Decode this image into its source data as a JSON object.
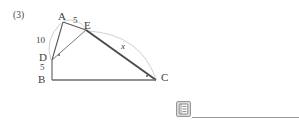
{
  "problem": {
    "index_label": "(3)"
  },
  "figure": {
    "type": "geometry-diagram",
    "vertices": [
      {
        "id": "A",
        "label": "A",
        "x": 63,
        "y": 22
      },
      {
        "id": "E",
        "label": "E",
        "x": 86,
        "y": 30
      },
      {
        "id": "D",
        "label": "D",
        "x": 52,
        "y": 60
      },
      {
        "id": "B",
        "label": "B",
        "x": 52,
        "y": 80
      },
      {
        "id": "C",
        "label": "C",
        "x": 155,
        "y": 80
      }
    ],
    "segment_labels": [
      {
        "id": "AD",
        "text": "10",
        "x": 40,
        "y": 41
      },
      {
        "id": "AE",
        "text": "5",
        "x": 74,
        "y": 22
      },
      {
        "id": "DB",
        "text": "5",
        "x": 41,
        "y": 68
      },
      {
        "id": "EC",
        "text": "x",
        "x": 122,
        "y": 46
      }
    ],
    "vertex_label_positions": [
      {
        "id": "A",
        "x": 58,
        "y": 12
      },
      {
        "id": "E",
        "x": 84,
        "y": 22
      },
      {
        "id": "D",
        "x": 40,
        "y": 52
      },
      {
        "id": "B",
        "x": 39,
        "y": 77
      },
      {
        "id": "C",
        "x": 162,
        "y": 75
      }
    ],
    "angle_marks": [
      {
        "at": "D",
        "x": 58,
        "y": 54
      },
      {
        "at": "C",
        "x": 146,
        "y": 76
      }
    ],
    "colors": {
      "stroke_dark": "#4a4a4a",
      "stroke_light": "#b9b9b9",
      "text": "#3d3d3d",
      "rule": "#9a9a9a",
      "icon_fill": "#8d8d8d",
      "icon_bg": "#d6d6d6",
      "background": "#ffffff"
    }
  },
  "toolbar": {
    "icon_name": "document-icon"
  }
}
